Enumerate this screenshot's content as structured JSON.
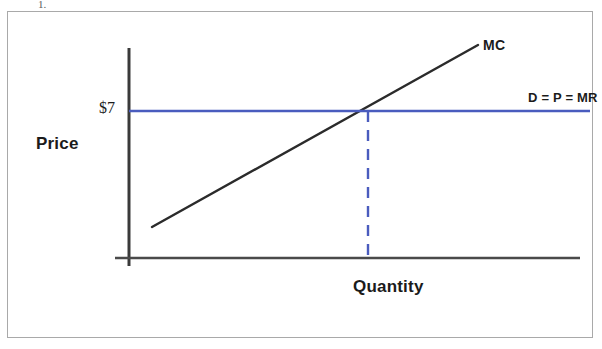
{
  "figure": {
    "scan_artifact_text": "1.",
    "background_color": "#ffffff",
    "frame_color": "#a9a9a9"
  },
  "chart_data": {
    "type": "line",
    "title": "",
    "subtitle": "",
    "xlabel": "Quantity",
    "ylabel": "Price",
    "grid": false,
    "legend_position": "inline-curve-labels",
    "xlim": [
      0,
      100
    ],
    "ylim": [
      0,
      100
    ],
    "axis_tick_labels": {
      "y": [
        "$7"
      ],
      "x": []
    },
    "annotations": [
      {
        "name": "price-tick-label",
        "text": "$7",
        "color": "#1b1b1b",
        "x_pixel": 99,
        "y_pixel": 99
      },
      {
        "name": "mc-curve-label",
        "text": "MC",
        "color": "#1b1b1b",
        "x_pixel": 483,
        "y_pixel": 37
      },
      {
        "name": "demand-curve-label",
        "text": "D = P = MR",
        "color": "#1b1b1b",
        "x_pixel": 528,
        "y_pixel": 90
      }
    ],
    "series": [
      {
        "name": "MC",
        "label": "MC",
        "type": "line",
        "color": "#2b2b2b",
        "style": "solid",
        "width": 2.4,
        "description": "Upward sloping marginal cost curve",
        "points_pixel": [
          [
            152,
            227
          ],
          [
            478,
            45
          ]
        ]
      },
      {
        "name": "D = P = MR",
        "label": "D = P = MR",
        "type": "line",
        "color": "#4a5cbe",
        "style": "solid",
        "width": 2.6,
        "description": "Horizontal demand / price / marginal revenue line at $7",
        "points_pixel": [
          [
            129,
            111
          ],
          [
            590,
            111
          ]
        ]
      },
      {
        "name": "equilibrium-quantity-dropline",
        "label": "",
        "type": "line",
        "color": "#4a5cbe",
        "style": "dashed",
        "width": 2.4,
        "description": "Dashed vertical line from the MC and MR intersection down to the quantity axis",
        "points_pixel": [
          [
            368,
            111
          ],
          [
            368,
            258
          ]
        ]
      }
    ],
    "intersection_point": {
      "name": "profit-maximizing-output",
      "price_label": "$7",
      "x_pixel": 368,
      "y_pixel": 111
    },
    "axes": {
      "y_axis": {
        "color": "#3a3a3a",
        "width": 3,
        "points_pixel": [
          [
            129,
            48
          ],
          [
            129,
            266
          ]
        ]
      },
      "x_axis": {
        "color": "#4a4a4a",
        "width": 2.6,
        "points_pixel": [
          [
            115,
            258
          ],
          [
            580,
            258
          ]
        ]
      }
    },
    "colors": {
      "mc_curve": "#2b2b2b",
      "demand_line": "#4a5cbe",
      "dropline": "#4a5cbe",
      "axis": "#3a3a3a",
      "text": "#1b1b1b"
    }
  }
}
